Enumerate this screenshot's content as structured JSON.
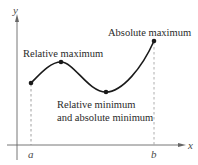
{
  "diagram": {
    "axes": {
      "x_label": "x",
      "y_label": "y",
      "tick_labels": {
        "a": "a",
        "b": "b"
      }
    },
    "points": [
      {
        "name": "endpoint-a",
        "x": 31,
        "y": 83
      },
      {
        "name": "relative-maximum",
        "x": 61,
        "y": 62
      },
      {
        "name": "relative-minimum",
        "x": 106,
        "y": 92
      },
      {
        "name": "absolute-maximum",
        "x": 154,
        "y": 41
      }
    ],
    "annotations": {
      "relative_maximum": "Relative maximum",
      "absolute_maximum": "Absolute maximum",
      "relative_minimum_line1": "Relative minimum",
      "relative_minimum_line2": "and absolute minimum"
    },
    "colors": {
      "curve": "#1a1a1a",
      "axis": "#555555",
      "dashed": "#888888",
      "text": "#2a2a2a"
    }
  }
}
